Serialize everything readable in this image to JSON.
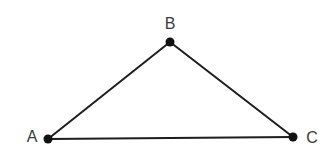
{
  "diagram": {
    "type": "triangle",
    "vertices": [
      {
        "id": "A",
        "label": "A",
        "x": 48,
        "y": 139,
        "label_x": 32,
        "label_y": 142
      },
      {
        "id": "B",
        "label": "B",
        "x": 170,
        "y": 42,
        "label_x": 170,
        "label_y": 29
      },
      {
        "id": "C",
        "label": "C",
        "x": 293,
        "y": 137,
        "label_x": 312,
        "label_y": 143
      }
    ],
    "edges": [
      {
        "from": "A",
        "to": "B"
      },
      {
        "from": "B",
        "to": "C"
      },
      {
        "from": "A",
        "to": "C"
      }
    ],
    "colors": {
      "edge": "#1e1e1e",
      "vertex": "#111111",
      "label": "#3a3a3a"
    }
  }
}
